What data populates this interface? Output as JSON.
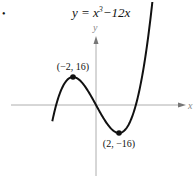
{
  "chart_data": {
    "type": "line",
    "title_parts": {
      "base": "y = x",
      "exp": "3",
      "rest": "−12x"
    },
    "xlabel": "x",
    "ylabel": "y",
    "bullet": "•",
    "function": "x^3 - 12x",
    "xlim": [
      -4,
      5.8
    ],
    "ylim": [
      -32,
      30
    ],
    "curve_domain": [
      -3.8,
      4.9
    ],
    "grid": false,
    "annotations": [
      {
        "x": -2,
        "y": 16,
        "label": "(−2, 16)",
        "position": "above"
      },
      {
        "x": 2,
        "y": -16,
        "label": "(2, −16)",
        "position": "below"
      }
    ]
  }
}
